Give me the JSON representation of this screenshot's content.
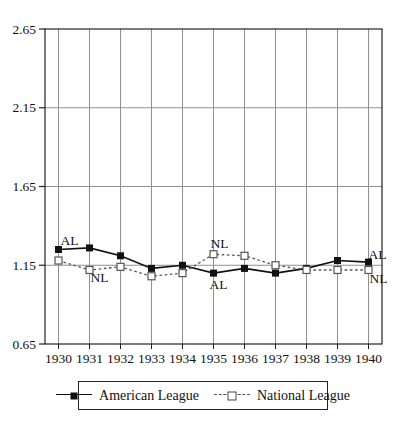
{
  "chart_data": {
    "type": "line",
    "title": "",
    "xlabel": "",
    "ylabel": "",
    "x": [
      1930,
      1931,
      1932,
      1933,
      1934,
      1935,
      1936,
      1937,
      1938,
      1939,
      1940
    ],
    "series": [
      {
        "name": "American League",
        "short_label": "AL",
        "line": "solid",
        "marker": "filled-square",
        "color": "#111111",
        "values": [
          1.25,
          1.26,
          1.21,
          1.13,
          1.15,
          1.1,
          1.13,
          1.1,
          1.13,
          1.18,
          1.17
        ]
      },
      {
        "name": "National League",
        "short_label": "NL",
        "line": "dashed",
        "marker": "open-square",
        "color": "#555555",
        "values": [
          1.18,
          1.12,
          1.14,
          1.08,
          1.1,
          1.22,
          1.21,
          1.15,
          1.12,
          1.12,
          1.12
        ]
      }
    ],
    "ylim": [
      0.65,
      2.65
    ],
    "yticks": [
      0.65,
      1.15,
      1.65,
      2.15,
      2.65
    ],
    "ytick_labels": [
      "0.65",
      "1.15",
      "1.65",
      "2.15",
      "2.65"
    ],
    "grid": true,
    "legend_position": "bottom",
    "annotations": [
      {
        "text": "AL",
        "year": 1930,
        "series": 0,
        "dx": 11,
        "dy": -9
      },
      {
        "text": "NL",
        "year": 1931,
        "series": 1,
        "dx": 10,
        "dy": 8
      },
      {
        "text": "NL",
        "year": 1935,
        "series": 1,
        "dx": 6,
        "dy": -11
      },
      {
        "text": "AL",
        "year": 1935,
        "series": 0,
        "dx": 5,
        "dy": 11
      },
      {
        "text": "AL",
        "year": 1940,
        "series": 0,
        "dx": 9,
        "dy": -8
      },
      {
        "text": "NL",
        "year": 1940,
        "series": 1,
        "dx": 10,
        "dy": 9
      }
    ],
    "colors": {
      "grid": "#909090",
      "frame": "#222222",
      "background": "#ffffff"
    }
  }
}
